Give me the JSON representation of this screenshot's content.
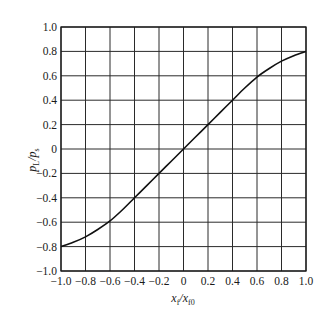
{
  "chart_data": {
    "type": "line",
    "title": "",
    "xlabel": "x_f/x_f0",
    "xlabel_main": "x",
    "xlabel_sub1": "f",
    "xlabel_slash": "/x",
    "xlabel_sub2": "f0",
    "ylabel": "p_L/p_s",
    "ylabel_main1": "p",
    "ylabel_sub1": "L",
    "ylabel_slash": "/p",
    "ylabel_sub2": "s",
    "xlim": [
      -1.0,
      1.0
    ],
    "ylim": [
      -1.0,
      1.0
    ],
    "grid": true,
    "legend": null,
    "x_ticks": [
      -1.0,
      -0.8,
      -0.6,
      -0.4,
      -0.2,
      0,
      0.2,
      0.4,
      0.6,
      0.8,
      1.0
    ],
    "x_tick_labels": [
      "−1.0",
      "−0.8",
      "−0.6",
      "−0.4",
      "−0.2",
      "0",
      "0.2",
      "0.4",
      "0.6",
      "0.8",
      "1.0"
    ],
    "y_ticks": [
      1.0,
      0.8,
      0.6,
      0.4,
      0.2,
      0,
      -0.2,
      -0.4,
      -0.6,
      -0.8,
      -1.0
    ],
    "y_tick_labels": [
      "1.0",
      "0.8",
      "0.6",
      "0.4",
      "0.2",
      "0",
      "−0.2",
      "−0.4",
      "−0.6",
      "−0.8",
      "−1.0"
    ],
    "series": [
      {
        "name": "p_L/p_s vs x_f/x_f0",
        "x": [
          -1.0,
          -0.9,
          -0.8,
          -0.7,
          -0.6,
          -0.5,
          -0.4,
          -0.3,
          -0.2,
          -0.1,
          0,
          0.1,
          0.2,
          0.3,
          0.4,
          0.5,
          0.6,
          0.7,
          0.8,
          0.9,
          1.0
        ],
        "y": [
          -0.8,
          -0.765,
          -0.72,
          -0.66,
          -0.59,
          -0.5,
          -0.4,
          -0.3,
          -0.2,
          -0.1,
          0,
          0.1,
          0.2,
          0.3,
          0.4,
          0.5,
          0.59,
          0.66,
          0.72,
          0.765,
          0.8
        ],
        "color": "#111111"
      }
    ]
  }
}
